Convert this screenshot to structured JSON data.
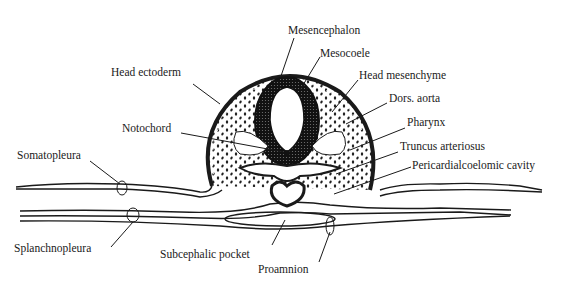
{
  "diagram": {
    "labels": {
      "mesencephalon": "Mesencephalon",
      "mesocoele": "Mesocoele",
      "head_ectoderm": "Head ectoderm",
      "head_mesenchyme": "Head mesenchyme",
      "dors_aorta": "Dors. aorta",
      "notochord": "Notochord",
      "pharynx": "Pharynx",
      "truncus_arteriosus": "Truncus arteriosus",
      "somatopleura": "Somatopleura",
      "pericardialcoelomic_cavity": "Pericardialcoelomic cavity",
      "splanchnopleura": "Splanchnopleura",
      "subcephalic_pocket": "Subcephalic pocket",
      "proamnion": "Proamnion"
    },
    "colors": {
      "ink": "#1a1a1a",
      "background": "#ffffff"
    }
  }
}
